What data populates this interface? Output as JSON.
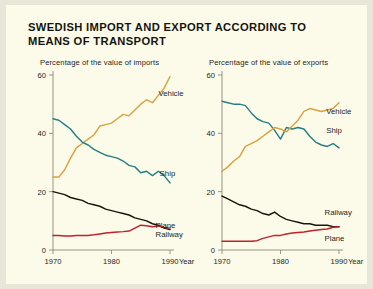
{
  "title": "SWEDISH IMPORT AND EXPORT ACCORDING TO\nMEANS OF TRANSPORT",
  "colors": {
    "background": "#fcfbe9",
    "outer": "#e8e6d8",
    "axis": "#8d8b79",
    "vehicle": "#d9a241",
    "ship": "#257f86",
    "railway": "#16160f",
    "plane": "#c0212b"
  },
  "axis_labels": {
    "x_unit": "Year",
    "y_ticks": [
      "0",
      "20",
      "40",
      "60"
    ],
    "x_ticks": [
      "1970",
      "1980",
      "1990"
    ]
  },
  "chart_data": [
    {
      "type": "line",
      "title": "Percentage of the value of imports",
      "xlabel": "Year",
      "ylabel": "",
      "xlim": [
        1970,
        1990
      ],
      "ylim": [
        0,
        60
      ],
      "yticks": [
        0,
        20,
        40,
        60
      ],
      "xticks": [
        1970,
        1980,
        1990
      ],
      "grid": false,
      "legend": "inline-labels",
      "x": [
        1970,
        1971,
        1972,
        1973,
        1974,
        1975,
        1976,
        1977,
        1978,
        1979,
        1980,
        1981,
        1982,
        1983,
        1984,
        1985,
        1986,
        1987,
        1988,
        1989,
        1990
      ],
      "series": [
        {
          "name": "Vehicle",
          "color": "#d9a241",
          "label_pos": {
            "x": 1987.0,
            "y": 54.0
          },
          "values": [
            25.0,
            25.0,
            27.5,
            31.5,
            35.0,
            36.5,
            38.0,
            39.5,
            42.5,
            43.0,
            43.5,
            45.0,
            46.5,
            46.0,
            48.0,
            50.0,
            51.5,
            50.5,
            53.0,
            55.5,
            59.5
          ]
        },
        {
          "name": "Ship",
          "color": "#257f86",
          "label_pos": {
            "x": 1987.2,
            "y": 26.5
          },
          "values": [
            45.0,
            44.5,
            43.0,
            41.5,
            39.0,
            37.0,
            36.0,
            34.5,
            33.5,
            32.5,
            32.0,
            31.5,
            30.5,
            29.0,
            28.5,
            26.5,
            27.0,
            25.5,
            27.0,
            25.5,
            23.0
          ]
        },
        {
          "name": "Railway",
          "color": "#16160f",
          "label_pos": {
            "x": 1986.5,
            "y": 5.4
          },
          "values": [
            20.0,
            19.5,
            19.0,
            18.0,
            17.5,
            17.0,
            16.0,
            15.5,
            15.0,
            14.0,
            13.5,
            13.0,
            12.5,
            12.0,
            11.0,
            10.5,
            10.0,
            9.0,
            8.5,
            7.5,
            7.0
          ]
        },
        {
          "name": "Plane",
          "color": "#c0212b",
          "label_pos": {
            "x": 1986.5,
            "y": 8.6
          },
          "values": [
            5.0,
            5.0,
            4.8,
            4.8,
            5.0,
            5.0,
            5.0,
            5.2,
            5.5,
            5.8,
            6.0,
            6.2,
            6.3,
            6.5,
            7.5,
            8.5,
            8.3,
            8.0,
            8.2,
            7.8,
            7.5
          ]
        }
      ]
    },
    {
      "type": "line",
      "title": "Percentage of the value of exports",
      "xlabel": "Year",
      "ylabel": "",
      "xlim": [
        1970,
        1990
      ],
      "ylim": [
        0,
        60
      ],
      "yticks": [
        0,
        20,
        40,
        60
      ],
      "xticks": [
        1970,
        1980,
        1990
      ],
      "grid": false,
      "legend": "inline-labels",
      "x": [
        1970,
        1971,
        1972,
        1973,
        1974,
        1975,
        1976,
        1977,
        1978,
        1979,
        1980,
        1981,
        1982,
        1983,
        1984,
        1985,
        1986,
        1987,
        1988,
        1989,
        1990
      ],
      "series": [
        {
          "name": "Ship",
          "color": "#257f86",
          "label_pos": {
            "x": 1986.8,
            "y": 41.0
          },
          "values": [
            51.0,
            50.5,
            50.0,
            50.0,
            49.5,
            47.0,
            45.0,
            44.0,
            43.5,
            41.0,
            38.0,
            42.0,
            41.5,
            42.0,
            41.5,
            39.0,
            37.0,
            36.0,
            35.5,
            36.5,
            35.0
          ]
        },
        {
          "name": "Vehicle",
          "color": "#d9a241",
          "label_pos": {
            "x": 1986.8,
            "y": 47.5
          },
          "values": [
            27.0,
            28.5,
            30.5,
            32.0,
            35.5,
            36.5,
            37.5,
            39.0,
            40.5,
            42.0,
            41.5,
            40.5,
            42.5,
            44.5,
            47.5,
            48.5,
            48.0,
            47.5,
            48.0,
            48.5,
            50.5
          ]
        },
        {
          "name": "Railway",
          "color": "#16160f",
          "label_pos": {
            "x": 1986.5,
            "y": 13.0
          },
          "values": [
            18.5,
            17.5,
            16.5,
            15.5,
            15.0,
            14.0,
            13.5,
            12.5,
            12.0,
            13.0,
            11.5,
            10.5,
            10.0,
            9.5,
            9.0,
            9.0,
            8.5,
            8.5,
            8.5,
            8.0,
            8.0
          ]
        },
        {
          "name": "Plane",
          "color": "#c0212b",
          "label_pos": {
            "x": 1986.5,
            "y": 4.0
          },
          "values": [
            3.0,
            3.0,
            3.0,
            3.0,
            3.0,
            3.0,
            3.2,
            4.0,
            4.5,
            5.0,
            5.0,
            5.5,
            5.8,
            6.0,
            6.2,
            6.5,
            6.8,
            7.0,
            7.2,
            7.8,
            8.0
          ]
        }
      ]
    }
  ]
}
